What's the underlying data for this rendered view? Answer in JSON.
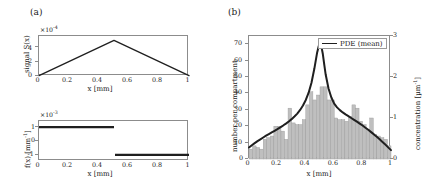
{
  "figure": {
    "panel_a_label": "(a)",
    "panel_b_label": "(b)"
  },
  "chart_data": [
    {
      "id": "signal",
      "type": "line",
      "title": "",
      "xlabel": "x  [mm]",
      "ylabel": "signal S(x)",
      "y_exponent": "×10 -4",
      "y_exponent_base": "×10",
      "y_exponent_sup": "-4",
      "xlim": [
        0,
        1
      ],
      "ylim": [
        0,
        5.6
      ],
      "xticks": [
        0,
        0.2,
        0.4,
        0.6,
        0.8,
        1
      ],
      "xticklabels": [
        "0",
        "0.2",
        "0.4",
        "0.6",
        "0.8",
        "1"
      ],
      "yticks": [
        0,
        2,
        4
      ],
      "yticklabels": [
        "0",
        "2",
        "4"
      ],
      "grid": false,
      "legend": null,
      "series": [
        {
          "name": "S(x)",
          "color": "#1f1f1f",
          "linewidth": 1.3,
          "x": [
            0,
            0.5,
            1
          ],
          "y": [
            0.05,
            5.0,
            0.05
          ]
        }
      ]
    },
    {
      "id": "source",
      "type": "line",
      "title": "",
      "xlabel": "x  [mm]",
      "ylabel": "f(x)  [mm -1]",
      "ylabel_base": "f(x)  [mm",
      "ylabel_sup": "-1",
      "ylabel_tail": "]",
      "y_exponent_base": "×10",
      "y_exponent_sup": "-3",
      "xlim": [
        0,
        1
      ],
      "ylim": [
        -1.45,
        1.45
      ],
      "xticks": [
        0,
        0.2,
        0.4,
        0.6,
        0.8,
        1
      ],
      "xticklabels": [
        "0",
        "0.2",
        "0.4",
        "0.6",
        "0.8",
        "1"
      ],
      "yticks": [
        -1,
        0,
        1
      ],
      "yticklabels": [
        "-1",
        "0",
        "1"
      ],
      "grid": false,
      "legend": null,
      "series": [
        {
          "name": "f(x) positive half",
          "color": "#1f1f1f",
          "linewidth": 2.2,
          "x": [
            0,
            0.5
          ],
          "y": [
            1,
            1
          ]
        },
        {
          "name": "f(x) negative half",
          "color": "#1f1f1f",
          "linewidth": 2.2,
          "x": [
            0.5,
            1
          ],
          "y": [
            -1,
            -1
          ]
        }
      ]
    },
    {
      "id": "histogram",
      "type": "bar",
      "title": "",
      "xlabel": "x  [mm]",
      "ylabel": "number per compartment",
      "ylabel_right_base": "concentration  [μm",
      "ylabel_right_sup": "-1",
      "ylabel_right_tail": "]",
      "xlim": [
        0,
        1
      ],
      "ylim": [
        0,
        75
      ],
      "ylim_right": [
        0,
        3
      ],
      "xticks": [
        0,
        0.2,
        0.4,
        0.6,
        0.8,
        1
      ],
      "xticklabels": [
        "0",
        "0.2",
        "0.4",
        "0.6",
        "0.8",
        "1"
      ],
      "yticks": [
        0,
        10,
        20,
        30,
        40,
        50,
        60,
        70
      ],
      "yticklabels": [
        "0",
        "10",
        "20",
        "30",
        "40",
        "50",
        "60",
        "70"
      ],
      "yticks_right": [
        0,
        1,
        2,
        3
      ],
      "yticklabels_right": [
        "0",
        "1",
        "2",
        "3"
      ],
      "grid": false,
      "bar_color": "#bfbfbf",
      "bar_edge_color": "#9a9a9a",
      "n_bins": 40,
      "bin_width": 0.025,
      "bin_centers": [
        0.0125,
        0.0375,
        0.0625,
        0.0875,
        0.1125,
        0.1375,
        0.1625,
        0.1875,
        0.2125,
        0.2375,
        0.2625,
        0.2875,
        0.3125,
        0.3375,
        0.3625,
        0.3875,
        0.4125,
        0.4375,
        0.4625,
        0.4875,
        0.5125,
        0.5375,
        0.5625,
        0.5875,
        0.6125,
        0.6375,
        0.6625,
        0.6875,
        0.7125,
        0.7375,
        0.7625,
        0.7875,
        0.8125,
        0.8375,
        0.8625,
        0.8875,
        0.9125,
        0.9375,
        0.9625,
        0.9875
      ],
      "counts": [
        6,
        8,
        7,
        6,
        12,
        13,
        14,
        20,
        20,
        17,
        12,
        31,
        22,
        21,
        21,
        24,
        33,
        41,
        36,
        39,
        44,
        44,
        36,
        36,
        25,
        24,
        24,
        23,
        26,
        33,
        31,
        23,
        21,
        18,
        25,
        15,
        14,
        13,
        12,
        8
      ],
      "legend": {
        "label": "PDE (mean)",
        "position": "top-right",
        "line_color": "#1f1f1f"
      },
      "series": [
        {
          "name": "PDE (mean)",
          "color": "#1f1f1f",
          "linewidth": 2.0,
          "x": [
            0.0,
            0.02,
            0.04,
            0.06,
            0.08,
            0.1,
            0.12,
            0.14,
            0.16,
            0.18,
            0.2,
            0.22,
            0.24,
            0.26,
            0.28,
            0.3,
            0.32,
            0.34,
            0.36,
            0.38,
            0.4,
            0.42,
            0.44,
            0.46,
            0.47,
            0.48,
            0.49,
            0.495,
            0.5,
            0.505,
            0.51,
            0.52,
            0.53,
            0.54,
            0.56,
            0.58,
            0.6,
            0.62,
            0.64,
            0.66,
            0.68,
            0.7,
            0.72,
            0.74,
            0.76,
            0.78,
            0.8,
            0.82,
            0.84,
            0.86,
            0.88,
            0.9,
            0.92,
            0.94,
            0.96,
            0.98,
            1.0
          ],
          "y": [
            7.0,
            8.4,
            9.7,
            10.9,
            12.0,
            13.1,
            14.2,
            15.2,
            16.2,
            17.2,
            18.2,
            19.3,
            20.4,
            21.6,
            22.9,
            24.3,
            25.9,
            27.7,
            29.9,
            32.6,
            36.0,
            40.4,
            46.5,
            55.0,
            60.0,
            65.0,
            68.5,
            69.8,
            70.2,
            69.8,
            68.5,
            64.0,
            57.5,
            51.5,
            43.0,
            37.5,
            33.8,
            31.5,
            29.8,
            28.4,
            27.2,
            26.1,
            25.0,
            23.9,
            22.8,
            21.6,
            20.4,
            19.1,
            17.8,
            16.4,
            15.0,
            13.5,
            12.0,
            10.4,
            8.8,
            7.1,
            5.4
          ]
        }
      ]
    }
  ]
}
